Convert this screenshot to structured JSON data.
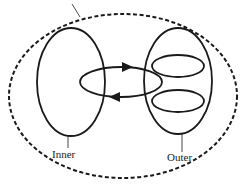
{
  "diagram": {
    "labels": {
      "inner": "Inner",
      "outer": "Outer"
    },
    "colors": {
      "stroke": "#1a1a1a",
      "background": "#ffffff"
    },
    "elements": [
      {
        "id": "environment-boundary",
        "shape": "dashed-ellipse"
      },
      {
        "id": "inner-region",
        "shape": "ellipse",
        "label": "Inner"
      },
      {
        "id": "outer-region",
        "shape": "ellipse",
        "label": "Outer"
      },
      {
        "id": "outer-sub-ellipse-1",
        "shape": "ellipse"
      },
      {
        "id": "outer-sub-ellipse-2",
        "shape": "ellipse"
      },
      {
        "id": "exchange-loop",
        "shape": "loop-with-arrows",
        "arrows": [
          "right",
          "left"
        ]
      }
    ]
  }
}
